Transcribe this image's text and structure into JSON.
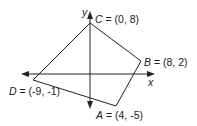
{
  "diagram": {
    "type": "coordinate-plane-quadrilateral",
    "axes": {
      "x_label": "x",
      "y_label": "y"
    },
    "vertices": [
      {
        "name": "A",
        "coords": "(4, -5)",
        "x": 4,
        "y": -5,
        "label": "= (4, -5)"
      },
      {
        "name": "B",
        "coords": "(8, 2)",
        "x": 8,
        "y": 2,
        "label": "= (8, 2)"
      },
      {
        "name": "C",
        "coords": "(0, 8)",
        "x": 0,
        "y": 8,
        "label": "= (0, 8)"
      },
      {
        "name": "D",
        "coords": "(-9, -1)",
        "x": -9,
        "y": -1,
        "label": "= (-9, -1)"
      }
    ],
    "edges": [
      [
        "A",
        "B"
      ],
      [
        "B",
        "C"
      ],
      [
        "C",
        "D"
      ],
      [
        "D",
        "A"
      ]
    ],
    "colors": {
      "stroke": "#222222",
      "background": "#ffffff"
    }
  }
}
